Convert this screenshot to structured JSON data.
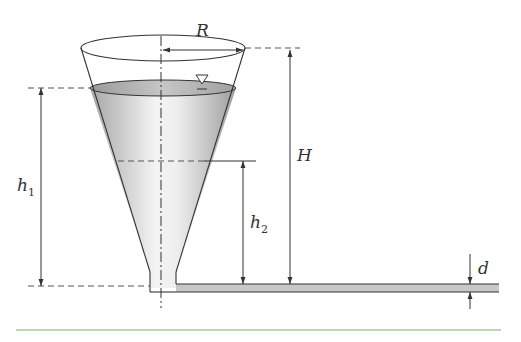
{
  "figure": {
    "labels": {
      "radius": "R",
      "total_height": "H",
      "h1_main": "h",
      "h1_sub": "1",
      "h2_main": "h",
      "h2_sub": "2",
      "pipe_diameter": "d"
    },
    "colors": {
      "outline": "#333333",
      "liquid_light": "#f2f2f2",
      "liquid_dark": "#a8a8a8",
      "pipe_fill": "#c8c8c8",
      "dash": "#555555",
      "footer_rule": "#7fae6e"
    },
    "symbols": {
      "free_surface": "inverted-triangle"
    }
  }
}
